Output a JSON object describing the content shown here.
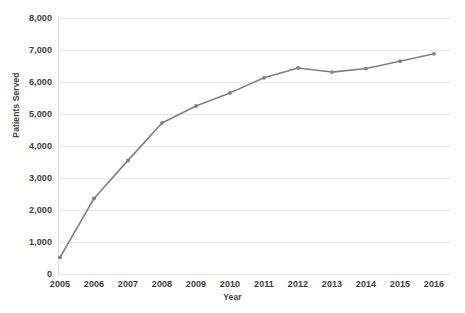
{
  "chart_data": {
    "type": "line",
    "title": "",
    "xlabel": "Year",
    "ylabel": "Patients Served",
    "categories": [
      "2005",
      "2006",
      "2007",
      "2008",
      "2009",
      "2010",
      "2011",
      "2012",
      "2013",
      "2014",
      "2015",
      "2016"
    ],
    "x": [
      2005,
      2006,
      2007,
      2008,
      2009,
      2010,
      2011,
      2012,
      2013,
      2014,
      2015,
      2016
    ],
    "series": [
      {
        "name": "Patients Served",
        "values": [
          520,
          2360,
          3550,
          4720,
          5250,
          5660,
          6130,
          6440,
          6310,
          6420,
          6650,
          6880
        ],
        "color": "#808080",
        "marker": "dot"
      }
    ],
    "ylim": [
      0,
      8000
    ],
    "ytick_values": [
      0,
      1000,
      2000,
      3000,
      4000,
      5000,
      6000,
      7000,
      8000
    ],
    "ytick_labels": [
      "0",
      "1,000",
      "2,000",
      "3,000",
      "4,000",
      "5,000",
      "6,000",
      "7,000",
      "8,000"
    ],
    "grid": {
      "horizontal": true,
      "vertical": false,
      "color": "#e9e9e9"
    },
    "legend": {
      "visible": false,
      "position": "none"
    },
    "background": "#ffffff",
    "axis_label_color": "#404040"
  }
}
